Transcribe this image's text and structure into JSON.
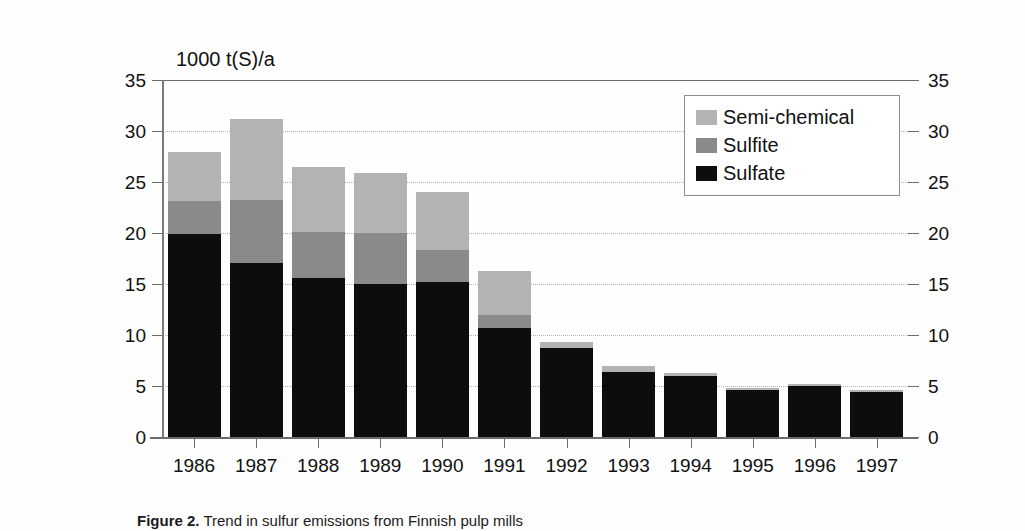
{
  "figure": {
    "axis_unit_label": "1000 t(S)/a",
    "caption_label": "Figure 2.",
    "caption_text": "Trend in sulfur emissions from Finnish pulp mills"
  },
  "legend": {
    "position": "top-right-inside",
    "items": [
      {
        "label": "Semi-chemical",
        "color": "#b3b3b3"
      },
      {
        "label": "Sulfite",
        "color": "#8a8a8a"
      },
      {
        "label": "Sulfate",
        "color": "#0d0d0d"
      }
    ]
  },
  "chart_data": {
    "type": "bar",
    "stacked": true,
    "title": "",
    "subtitle": "",
    "xlabel": "",
    "ylabel": "1000 t(S)/a",
    "ylim": [
      0,
      35
    ],
    "yticks": [
      0,
      5,
      10,
      15,
      20,
      25,
      30,
      35
    ],
    "ytick_labels": [
      "0",
      "5",
      "10",
      "15",
      "20",
      "25",
      "30",
      "35"
    ],
    "grid": "horizontal-dotted",
    "dual_axis": true,
    "right_ytick_labels": [
      "0",
      "5",
      "10",
      "15",
      "20",
      "25",
      "30",
      "35"
    ],
    "categories": [
      "1986",
      "1987",
      "1988",
      "1989",
      "1990",
      "1991",
      "1992",
      "1993",
      "1994",
      "1995",
      "1996",
      "1997"
    ],
    "series": [
      {
        "name": "Sulfate",
        "color": "#0d0d0d",
        "values": [
          19.9,
          17.1,
          15.6,
          15.0,
          15.2,
          10.7,
          8.7,
          6.4,
          6.0,
          4.6,
          5.0,
          4.4
        ]
      },
      {
        "name": "Sulfite",
        "color": "#8a8a8a",
        "values": [
          3.2,
          6.1,
          4.5,
          5.0,
          3.1,
          1.3,
          0.0,
          0.0,
          0.0,
          0.0,
          0.0,
          0.0
        ]
      },
      {
        "name": "Semi-chemical",
        "color": "#b3b3b3",
        "values": [
          4.8,
          8.0,
          6.4,
          5.9,
          5.7,
          4.3,
          0.6,
          0.6,
          0.3,
          0.2,
          0.2,
          0.2
        ]
      }
    ],
    "totals": [
      27.9,
      31.2,
      26.5,
      25.9,
      24.0,
      16.3,
      9.3,
      7.0,
      6.3,
      4.8,
      5.2,
      4.6
    ]
  }
}
